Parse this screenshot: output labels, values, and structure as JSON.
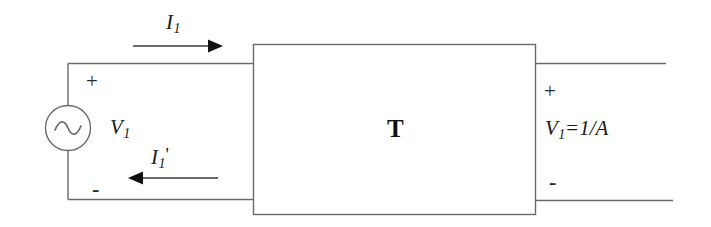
{
  "diagram": {
    "background_color": "#ffffff",
    "line_color": "#6b6b6b",
    "text_color": "#1a1a1a",
    "labels": {
      "input_current": "I",
      "input_current_sub": "1",
      "reflected_current": "I",
      "reflected_current_sub": "1",
      "reflected_current_prime": "'",
      "input_voltage": "V",
      "input_voltage_sub": "1",
      "output_expression_var": "V",
      "output_expression_sub": "1",
      "output_expression_eq": "=",
      "output_expression_value": "1/A",
      "block": "T",
      "plus_input": "+",
      "minus_input": "-",
      "plus_output": "+",
      "minus_output": "-"
    },
    "components": {
      "source": "ac-voltage-source",
      "source_symbol": "sine-wave",
      "block_name": "T",
      "arrow_top_direction": "right",
      "arrow_bottom_direction": "left"
    }
  }
}
